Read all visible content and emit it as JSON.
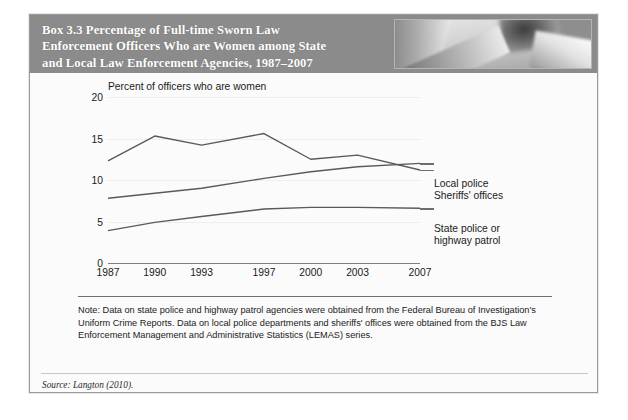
{
  "box": {
    "title": "Box 3.3   Percentage of Full-time Sworn Law\nEnforcement Officers Who are Women among State\nand Local Law Enforcement Agencies, 1987–2007",
    "header_bg": "#8b8b8b",
    "header_photo_name": "police-officer-photo"
  },
  "note": {
    "text": "Note: Data on state police and highway patrol agencies were obtained from the Federal Bureau of Investigation's Uniform Crime Reports. Data on local police departments and sheriffs' offices were obtained from the BJS Law Enforcement Management and Administrative Statistics (LEMAS) series."
  },
  "source": {
    "text": "Source: Langton (2010)."
  },
  "chart_data": {
    "type": "line",
    "title": "Percentage of Full-time Sworn Law Enforcement Officers Who are Women among State and Local Law Enforcement Agencies, 1987–2007",
    "xlabel": "",
    "ylabel": "Percent of officers who are women",
    "axis_caption": "Percent of officers who are women",
    "categories": [
      "1987",
      "1990",
      "1993",
      "1997",
      "2000",
      "2003",
      "2007"
    ],
    "x_positions": [
      1987,
      1990,
      1993,
      1997,
      2000,
      2003,
      2007
    ],
    "xlim": [
      1987,
      2007
    ],
    "ylim": [
      0,
      20
    ],
    "yticks": [
      0,
      5,
      10,
      15,
      20
    ],
    "ytick_labels": [
      "0",
      "5",
      "10",
      "15",
      "20"
    ],
    "grid": true,
    "legend_position": "right-inline",
    "series": [
      {
        "name": "Local police",
        "label": "Local police",
        "color": "#5a5a5a",
        "values": [
          12.3,
          15.3,
          14.2,
          15.6,
          12.5,
          13.0,
          11.2
        ]
      },
      {
        "name": "Sheriffs' offices",
        "label": "Sheriffs' offices",
        "color": "#5a5a5a",
        "values": [
          7.8,
          8.4,
          9.0,
          10.2,
          11.0,
          11.6,
          12.0
        ]
      },
      {
        "name": "State police or highway patrol",
        "label": "State police or\nhighway patrol",
        "color": "#5a5a5a",
        "values": [
          3.9,
          4.9,
          5.6,
          6.5,
          6.7,
          6.7,
          6.6
        ]
      }
    ]
  }
}
